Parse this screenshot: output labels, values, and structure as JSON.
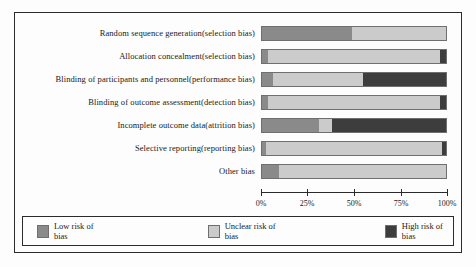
{
  "chart_data": {
    "type": "bar",
    "orientation": "horizontal",
    "stacked": true,
    "normalized_percent": true,
    "title": "",
    "xlabel": "",
    "ylabel": "",
    "xlim": [
      0,
      100
    ],
    "grid": false,
    "legend_position": "bottom",
    "tick_labels": [
      "0%",
      "25%",
      "50%",
      "75%",
      "100%"
    ],
    "tick_values": [
      0,
      25,
      50,
      75,
      100
    ],
    "categories": [
      "Random sequence generation(selection bias)",
      "Allocation concealment(selection bias)",
      "Blinding of participants and personnel(performance bias)",
      "Blinding of outcome assessment(detection bias)",
      "Incomplete outcome data(attrition bias)",
      "Selective reporting(reporting bias)",
      "Other bias"
    ],
    "series": [
      {
        "name": "Low risk of bias",
        "color": "#8a8a8a",
        "values": [
          49,
          3,
          6,
          3,
          31,
          2,
          9
        ]
      },
      {
        "name": "Unclear risk of bias",
        "color": "#cbcbcb",
        "values": [
          51,
          94,
          49,
          94,
          7,
          96,
          91
        ]
      },
      {
        "name": "High risk of bias",
        "color": "#3d3d3d",
        "values": [
          0,
          3,
          45,
          3,
          62,
          2,
          0
        ]
      }
    ]
  },
  "legend": {
    "items": [
      {
        "label": "Low risk of bias",
        "color": "#8a8a8a"
      },
      {
        "label": "Unclear risk of bias",
        "color": "#cbcbcb"
      },
      {
        "label": "High risk of bias",
        "color": "#3d3d3d"
      }
    ]
  }
}
